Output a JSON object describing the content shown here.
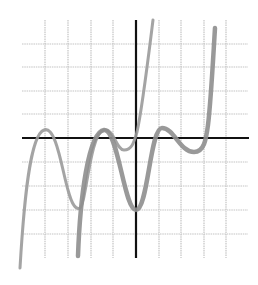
{
  "figure": {
    "colors": {
      "background": "#ffffff",
      "grid": "#c4c4c4",
      "axis": "#111111",
      "curve_a": "#9a9a9a",
      "curve_b": "#8e8e8e"
    },
    "grid": {
      "x_lines": [
        45,
        68,
        91,
        113,
        159,
        181,
        204,
        226
      ],
      "y_lines": [
        44,
        67,
        91,
        114,
        162,
        186,
        210,
        234
      ],
      "x_extent": [
        22,
        248
      ],
      "y_extent": [
        20,
        258
      ]
    },
    "axes": {
      "x_axis": {
        "y": 138,
        "x1": 22,
        "x2": 249
      },
      "y_axis": {
        "x": 136,
        "y1": 20,
        "y2": 258
      }
    },
    "curves": [
      {
        "name": "curve-a",
        "stroke_width": 3,
        "path": "M 20 268 C 24 200, 30 135, 44 130 C 56 125, 62 170, 68 190 C 72 205, 76 210, 80 208 C 86 205, 90 132, 104 130 C 114 128, 116 150, 124 150 C 132 150, 134 142, 137 132 C 142 110, 148 60, 153 20"
      },
      {
        "name": "curve-b",
        "stroke_width": 4.5,
        "path": "M 78 256 C 80 200, 88 132, 104 130 C 118 128, 124 210, 136 210 C 148 210, 150 128, 162 128 C 174 128, 180 152, 194 152 C 204 152, 206 140, 208 125 C 211 100, 213 60, 215 28"
      }
    ]
  }
}
